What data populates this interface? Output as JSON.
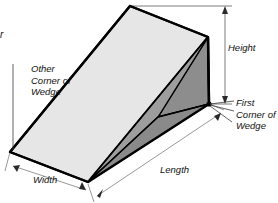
{
  "figure": {
    "type": "technical-illustration",
    "background_color": "#ffffff"
  },
  "labels": {
    "height": "Height",
    "length": "Length",
    "width": "Width",
    "first_corner": "First\nCorner of\nWedge",
    "other_corner": "Other\nCorner of\nWedge",
    "clipped_text": "r"
  },
  "shading": {
    "top_face": "#e6e6e6",
    "side_face_light": "#eaeaea",
    "inner_face_dark": "#8d8d8d",
    "inner_face_mid": "#9a9a9a",
    "outline": "#000000",
    "dimension_line": "#6e6e6e"
  },
  "dimensions": [
    {
      "name": "Height",
      "orientation": "vertical",
      "side": "right"
    },
    {
      "name": "Length",
      "orientation": "diagonal",
      "side": "bottom-right"
    },
    {
      "name": "Width",
      "orientation": "diagonal",
      "side": "bottom-left"
    }
  ],
  "annotations": [
    {
      "name": "First Corner of Wedge",
      "target": "right-bottom-vertex"
    },
    {
      "name": "Other Corner of Wedge",
      "target": "left-bottom-vertex"
    }
  ]
}
